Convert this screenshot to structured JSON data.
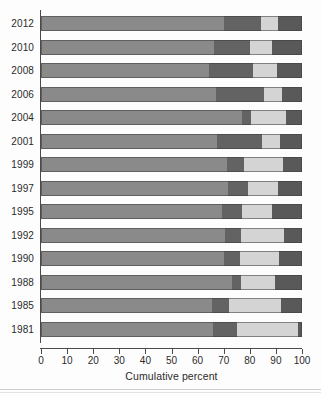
{
  "chart_data": {
    "type": "bar",
    "orientation": "horizontal",
    "stacked": true,
    "title": "",
    "xlabel": "Cumulative percent",
    "ylabel": "",
    "xlim": [
      0,
      100
    ],
    "xticks": [
      0,
      10,
      20,
      30,
      40,
      50,
      60,
      70,
      80,
      90,
      100
    ],
    "xtick_labels": [
      "0",
      "10",
      "20",
      "30",
      "40",
      "50",
      "60",
      "70",
      "80",
      "90",
      "100"
    ],
    "grid": false,
    "legend": "none",
    "categories": [
      "2012",
      "2010",
      "2008",
      "2006",
      "2004",
      "2001",
      "1999",
      "1997",
      "1995",
      "1992",
      "1990",
      "1988",
      "1985",
      "1981"
    ],
    "series": [
      {
        "name": "segment-1",
        "color": "#8a8a8a",
        "values": [
          70.2,
          66.1,
          64.2,
          67.1,
          77.0,
          67.5,
          71.2,
          71.8,
          69.5,
          70.6,
          70.2,
          73.3,
          65.6,
          66.0
        ]
      },
      {
        "name": "segment-2",
        "color": "#636363",
        "values": [
          14.2,
          14.1,
          17.2,
          18.2,
          3.6,
          17.1,
          6.4,
          7.6,
          7.5,
          5.9,
          6.1,
          3.4,
          6.5,
          9.2
        ]
      },
      {
        "name": "segment-3",
        "color": "#d4d4d4",
        "values": [
          6.5,
          8.3,
          9.0,
          7.1,
          13.3,
          7.1,
          15.1,
          11.3,
          11.5,
          16.7,
          14.7,
          13.1,
          20.0,
          23.3
        ]
      },
      {
        "name": "segment-4",
        "color": "#595959",
        "values": [
          9.1,
          11.5,
          9.6,
          7.6,
          6.1,
          8.3,
          7.3,
          9.3,
          11.5,
          6.8,
          9.0,
          10.2,
          7.9,
          1.5
        ]
      }
    ],
    "cumulative_boundaries": [
      {
        "category": "2012",
        "stops": [
          70.2,
          84.4,
          90.9,
          100
        ]
      },
      {
        "category": "2010",
        "stops": [
          66.1,
          80.2,
          88.5,
          100
        ]
      },
      {
        "category": "2008",
        "stops": [
          64.2,
          81.4,
          90.4,
          100
        ]
      },
      {
        "category": "2006",
        "stops": [
          67.1,
          85.3,
          92.4,
          100
        ]
      },
      {
        "category": "2004",
        "stops": [
          77.0,
          80.6,
          93.9,
          100
        ]
      },
      {
        "category": "2001",
        "stops": [
          67.5,
          84.6,
          91.7,
          100
        ]
      },
      {
        "category": "1999",
        "stops": [
          71.2,
          77.6,
          92.7,
          100
        ]
      },
      {
        "category": "1997",
        "stops": [
          71.8,
          79.4,
          90.7,
          100
        ]
      },
      {
        "category": "1995",
        "stops": [
          69.5,
          77.0,
          88.5,
          100
        ]
      },
      {
        "category": "1992",
        "stops": [
          70.6,
          76.5,
          93.2,
          100
        ]
      },
      {
        "category": "1990",
        "stops": [
          70.2,
          76.3,
          91.0,
          100
        ]
      },
      {
        "category": "1988",
        "stops": [
          73.3,
          76.7,
          89.8,
          100
        ]
      },
      {
        "category": "1985",
        "stops": [
          65.6,
          72.1,
          92.1,
          100
        ]
      },
      {
        "category": "1981",
        "stops": [
          66.0,
          75.2,
          98.5,
          100
        ]
      }
    ]
  },
  "colors": {
    "segment_1": "#8a8a8a",
    "segment_2": "#636363",
    "segment_3": "#d4d4d4",
    "segment_4": "#595959",
    "axis": "#4a4a4a",
    "text": "#2b2b2b",
    "background": "#fdfdfd"
  }
}
